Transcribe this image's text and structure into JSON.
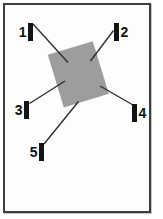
{
  "figure": {
    "page": {
      "background_color": "#fdfdfd",
      "border_color": "#3d3d3d"
    },
    "diagram": {
      "line_color": "#2f2f2f",
      "label_color": "#111111",
      "marker": {
        "width": 5,
        "height": 18,
        "color": "#141414"
      },
      "specimen": {
        "shape": "rectangle",
        "color": "#9d9d9d",
        "center_x": 78.3,
        "center_y": 74.3,
        "width": 47,
        "height": 55,
        "rotation_deg": -17
      },
      "callouts": [
        {
          "label": "1",
          "digit_side": "left",
          "bar_x": 28,
          "bar_y": 23,
          "line": {
            "x1": 33,
            "y1": 24,
            "x2": 68,
            "y2": 62.5
          }
        },
        {
          "label": "2",
          "digit_side": "right",
          "bar_x": 114,
          "bar_y": 23,
          "line": {
            "x1": 113.5,
            "y1": 30.5,
            "x2": 90.5,
            "y2": 61
          }
        },
        {
          "label": "3",
          "digit_side": "left",
          "bar_x": 24,
          "bar_y": 101,
          "line": {
            "x1": 29.5,
            "y1": 103.5,
            "x2": 65,
            "y2": 81
          }
        },
        {
          "label": "4",
          "digit_side": "right",
          "bar_x": 132,
          "bar_y": 104,
          "line": {
            "x1": 133,
            "y1": 105,
            "x2": 100,
            "y2": 86
          }
        },
        {
          "label": "5",
          "digit_side": "left",
          "bar_x": 39,
          "bar_y": 143,
          "line": {
            "x1": 44,
            "y1": 144,
            "x2": 78.5,
            "y2": 101.5
          }
        }
      ]
    }
  }
}
